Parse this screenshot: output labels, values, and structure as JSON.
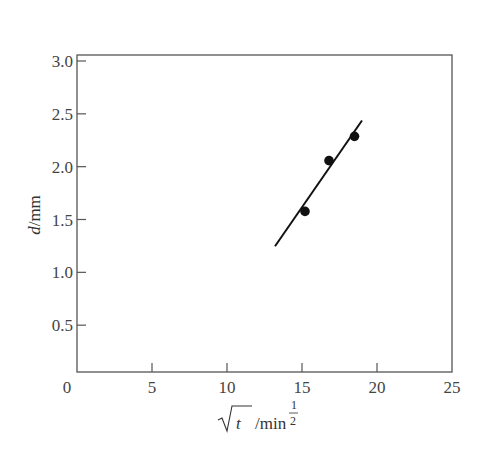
{
  "chart_data": {
    "type": "scatter",
    "title": "",
    "xlabel": "√t /min^(1/2)",
    "xlabel_parts": {
      "sqrt_var": "t",
      "unit": "/min",
      "exp_num": "1",
      "exp_den": "2"
    },
    "ylabel": "d/mm",
    "ylabel_parts": {
      "var": "d",
      "unit": "/mm"
    },
    "xlim": [
      0,
      25
    ],
    "ylim": [
      0,
      3.0
    ],
    "x_ticks": [
      "0",
      "5",
      "10",
      "15",
      "20",
      "25"
    ],
    "y_ticks": [
      "0.5",
      "1.0",
      "1.5",
      "2.0",
      "2.5",
      "3.0"
    ],
    "grid": false,
    "legend": null,
    "series": [
      {
        "name": "measured",
        "marker": "filled-circle",
        "x": [
          15.2,
          16.8,
          18.5
        ],
        "y": [
          1.52,
          2.0,
          2.23
        ]
      },
      {
        "name": "linear fit",
        "style": "line",
        "x": [
          13.2,
          19.0
        ],
        "y": [
          1.19,
          2.38
        ]
      }
    ]
  }
}
